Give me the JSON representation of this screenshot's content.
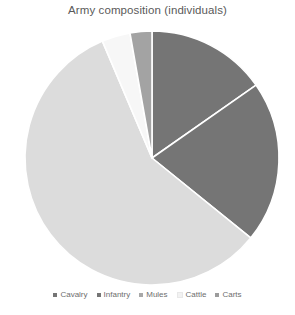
{
  "chart": {
    "title": "Army composition (individuals)"
  },
  "legend": {
    "position": "bottom",
    "items": [
      {
        "label": "Cavalry",
        "color": "#757575",
        "swatch_name": "legend-swatch-cavalry"
      },
      {
        "label": "Infantry",
        "color": "#757575",
        "swatch_name": "legend-swatch-infantry"
      },
      {
        "label": "Mules",
        "color": "#a8a8a8",
        "swatch_name": "legend-swatch-mules"
      },
      {
        "label": "Cattle",
        "color": "#f2f2f2",
        "swatch_name": "legend-swatch-cattle"
      },
      {
        "label": "Carts",
        "color": "#9c9c9c",
        "swatch_name": "legend-swatch-carts"
      }
    ]
  },
  "chart_data": {
    "type": "pie",
    "title": "Army composition (individuals)",
    "xlabel": "",
    "ylabel": "",
    "legend_position": "bottom",
    "grid": false,
    "start_angle_deg": 0,
    "direction": "clockwise",
    "categories": [
      "Cavalry",
      "Infantry",
      "Mules",
      "Cattle",
      "Carts"
    ],
    "values": [
      15.3,
      20.6,
      3.6,
      57.8,
      2.7
    ],
    "units": "percent",
    "slices": [
      {
        "label": "Cavalry",
        "value": 15.3,
        "angle_deg": 55,
        "start_deg": 0,
        "end_deg": 55,
        "color": "#757575"
      },
      {
        "label": "Infantry",
        "value": 20.6,
        "angle_deg": 74,
        "start_deg": 55,
        "end_deg": 129,
        "color": "#757575"
      },
      {
        "label": "Mules",
        "value": 3.6,
        "angle_deg": 13,
        "start_deg": 337,
        "end_deg": 350,
        "color": "#f7f7f7"
      },
      {
        "label": "Cattle",
        "value": 57.8,
        "angle_deg": 208,
        "start_deg": 129,
        "end_deg": 337,
        "color": "#dcdcdc"
      },
      {
        "label": "Carts",
        "value": 2.7,
        "angle_deg": 10,
        "start_deg": 350,
        "end_deg": 360,
        "color": "#a3a3a3"
      }
    ]
  },
  "geometry": {
    "center_x": 152,
    "center_y": 136,
    "radius": 127
  },
  "colors": {
    "background": "#ffffff",
    "title": "#5a5a5a",
    "legend_text": "#6e6e6e",
    "slice_divider": "#ffffff"
  }
}
